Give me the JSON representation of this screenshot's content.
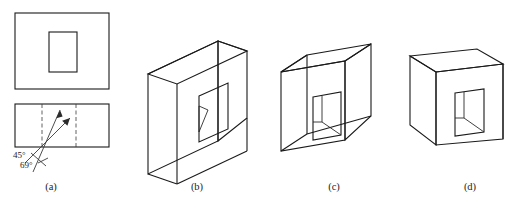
{
  "figure": {
    "background_color": "#ffffff",
    "line_color": "#1a1a1a",
    "panels": [
      {
        "id": "a",
        "caption": "(a)",
        "type": "orthographic-views",
        "description": "Top view rectangle with centered rectangular hole above a front view rectangle with viewing direction arrows",
        "annotations": [
          {
            "name": "angle-45",
            "text": "45°"
          },
          {
            "name": "angle-69",
            "text": "69°"
          }
        ]
      },
      {
        "id": "b",
        "caption": "(b)",
        "type": "axonometric-solid",
        "description": "Deep rectangular block with rectangular through hole, interior diagonal wall visible"
      },
      {
        "id": "c",
        "caption": "(c)",
        "type": "axonometric-solid",
        "description": "Shallow rectangular block with rectangular through hole, interior vertical and diagonal walls visible"
      },
      {
        "id": "d",
        "caption": "(d)",
        "type": "axonometric-solid",
        "description": "Rectangular block viewed from upper left with rectangular through hole, interior vertical and diagonal walls visible"
      }
    ]
  }
}
